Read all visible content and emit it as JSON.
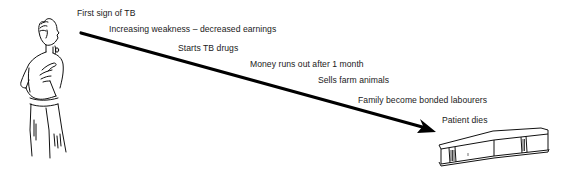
{
  "diagram": {
    "type": "timeline-arrow",
    "start_figure": "coughing-man",
    "end_figure": "coffin",
    "arrow_color": "#000000",
    "text_color": "#1a1a1a",
    "steps": [
      {
        "label": "First sign of TB",
        "x": 77,
        "y": 9
      },
      {
        "label": "Increasing weakness – decreased earnings",
        "x": 109,
        "y": 25
      },
      {
        "label": "Starts TB drugs",
        "x": 178,
        "y": 44
      },
      {
        "label": "Money runs out after 1 month",
        "x": 250,
        "y": 60
      },
      {
        "label": "Sells farm animals",
        "x": 318,
        "y": 76
      },
      {
        "label": "Family become bonded labourers",
        "x": 358,
        "y": 96
      },
      {
        "label": "Patient dies",
        "x": 442,
        "y": 116
      }
    ]
  }
}
